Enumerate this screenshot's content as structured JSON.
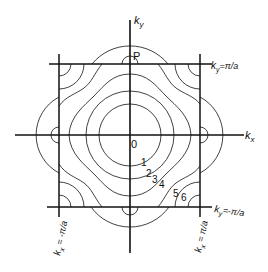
{
  "figure": {
    "type": "constant-energy contour diagram in first Brillouin zone (square lattice)",
    "axes": {
      "x_label_main": "k",
      "x_label_sub": "x",
      "y_label_main": "k",
      "y_label_sub": "y"
    },
    "origin_label": "0",
    "point_label": "P",
    "boundaries": {
      "top": {
        "main": "k",
        "sub": "y",
        "eq": "=π/a"
      },
      "bottom": {
        "main": "k",
        "sub": "y",
        "eq": "=-π/a"
      },
      "left": {
        "main": "k",
        "sub": "x",
        "eq": " = -π/a"
      },
      "right": {
        "main": "k",
        "sub": "x",
        "eq": " = π/a"
      }
    },
    "contour_labels": [
      "1",
      "2",
      "3",
      "4",
      "5",
      "6"
    ],
    "colors": {
      "line": "#111111",
      "background": "#ffffff"
    }
  }
}
